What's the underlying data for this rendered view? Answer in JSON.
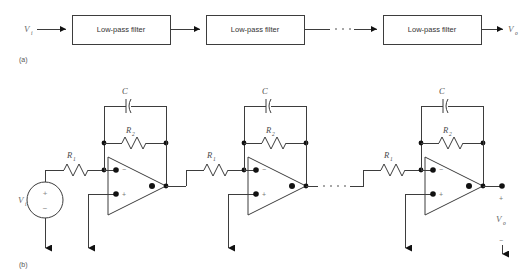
{
  "figure": {
    "title_a": "(a)",
    "title_b": "(b)",
    "input_label": "V",
    "input_sub": "i",
    "output_label": "V",
    "output_sub": "o"
  },
  "block_diagram": {
    "blocks": [
      {
        "label": "Low-pass filter"
      },
      {
        "label": "Low-pass filter"
      },
      {
        "label": "Low-pass filter"
      }
    ],
    "input_terminal": "V",
    "input_terminal_sub": "i",
    "output_terminal": "V",
    "output_terminal_sub": "o",
    "ellipsis": "· · ·"
  },
  "circuit": {
    "source": {
      "label": "V",
      "label_sub": "i",
      "plus": "+",
      "minus": "−"
    },
    "stages": [
      {
        "r1": "R",
        "r1_sub": "1",
        "r2": "R",
        "r2_sub": "2",
        "c": "C",
        "opamp_inverting": "−",
        "opamp_noninverting": "+"
      },
      {
        "r1": "R",
        "r1_sub": "1",
        "r2": "R",
        "r2_sub": "2",
        "c": "C",
        "opamp_inverting": "−",
        "opamp_noninverting": "+"
      },
      {
        "r1": "R",
        "r1_sub": "1",
        "r2": "R",
        "r2_sub": "2",
        "c": "C",
        "opamp_inverting": "−",
        "opamp_noninverting": "+"
      }
    ],
    "output": {
      "label": "V",
      "label_sub": "o",
      "plus": "+",
      "minus": "−"
    },
    "ellipsis": "· · ·"
  },
  "colors": {
    "wire": "#3d3d3d",
    "node": "#111111",
    "text": "#4a4a4a",
    "background": "#ffffff"
  }
}
